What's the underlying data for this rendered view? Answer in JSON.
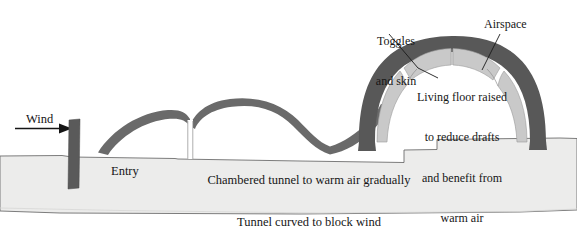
{
  "diagram": {
    "type": "architectural-cross-section",
    "colors": {
      "shell_dark": "#585858",
      "airspace_light": "#c9c9c9",
      "ground_fill": "#ececeb",
      "ground_outline": "#6e6e6e",
      "post_dark": "#5a5a5a",
      "text": "#161616",
      "background": "#ffffff"
    },
    "labels": {
      "wind": "Wind",
      "entry": "Entry",
      "tunnel_line1": "Chambered tunnel to warm air gradually",
      "tunnel_line2": "Tunnel curved to block wind",
      "toggles_line1": "Toggles",
      "toggles_line2": "and skin",
      "airspace": "Airspace",
      "floor_line1": "Living floor raised",
      "floor_line2": "to reduce drafts",
      "floor_line3": "and benefit from",
      "floor_line4": "warm air"
    },
    "elements": {
      "wind_arrow": "arrow-right-icon",
      "windbreak_post": "windbreak-post",
      "tunnel_arches": "tunnel-arch-shape",
      "chamber_divider": "chamber-divider-line",
      "dome": "dome-shell-shape",
      "airspace_panels": "airspace-panel-shape",
      "ground": "ground-profile"
    }
  }
}
